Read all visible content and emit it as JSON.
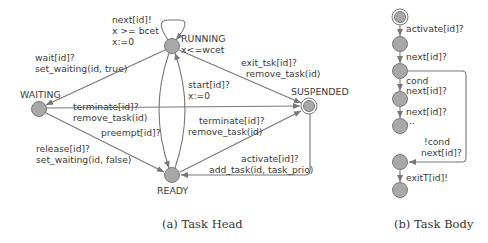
{
  "colors": {
    "node_fill": "#a8a8a8",
    "node_stroke": "#7a7a7a",
    "edge": "#777777",
    "text": "#3a3a3a"
  },
  "task_head": {
    "caption": "(a) Task Head",
    "states": {
      "running": {
        "name": "RUNNING",
        "invariant": "x<=wcet"
      },
      "waiting": {
        "name": "WAITING"
      },
      "suspended": {
        "name": "SUSPENDED"
      },
      "ready": {
        "name": "READY"
      }
    },
    "edges": {
      "running_self": {
        "line1": "next[id]!",
        "line2": "x >= bcet",
        "line3": "x:=0"
      },
      "running_to_waiting": {
        "line1": "wait[id]?",
        "line2": "set_waiting(id, true)"
      },
      "running_to_suspended": {
        "line1": "exit_tsk[id]?",
        "line2": "remove_task(id)"
      },
      "ready_to_running": {
        "line1": "start[id]?",
        "line2": "x:=0"
      },
      "waiting_to_suspended": {
        "line1": "terminate[id]?",
        "line2": "remove_task(id)"
      },
      "running_to_ready": {
        "line1": "preempt[id]?"
      },
      "ready_to_suspended": {
        "line1": "terminate[id]?",
        "line2": "remove_task(id)"
      },
      "waiting_to_ready": {
        "line1": "release[id]?",
        "line2": "set_waiting(id, false)"
      },
      "suspended_to_ready": {
        "line1": "activate[id]?",
        "line2": "add_task(id, task_prio)"
      }
    }
  },
  "task_body": {
    "caption": "(b) Task Body",
    "edges": {
      "e1": {
        "line1": "activate[id]?"
      },
      "e2": {
        "line1": "next[id]?"
      },
      "e3": {
        "line1": "cond",
        "line2": "next[id]?"
      },
      "e4": {
        "line1": "next[id]?",
        "line2": "..."
      },
      "e5": {
        "line1": "!cond",
        "line2": "next[id]?"
      },
      "e6": {
        "line1": "exitT[id]!"
      }
    }
  }
}
